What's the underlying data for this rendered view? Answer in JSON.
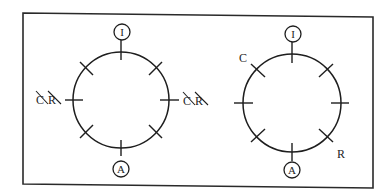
{
  "figure": {
    "panels": [
      {
        "id": "left",
        "top_marker": "I",
        "bottom_marker": "A",
        "left_label": "C̸R̸",
        "right_label": "C̸R̸",
        "left_label_parts": [
          "C",
          "R"
        ],
        "right_label_parts": [
          "C",
          "R"
        ],
        "tick_count": 8
      },
      {
        "id": "right",
        "top_marker": "I",
        "bottom_marker": "A",
        "upper_left_label": "C",
        "lower_right_label": "R",
        "tick_count": 8
      }
    ]
  }
}
